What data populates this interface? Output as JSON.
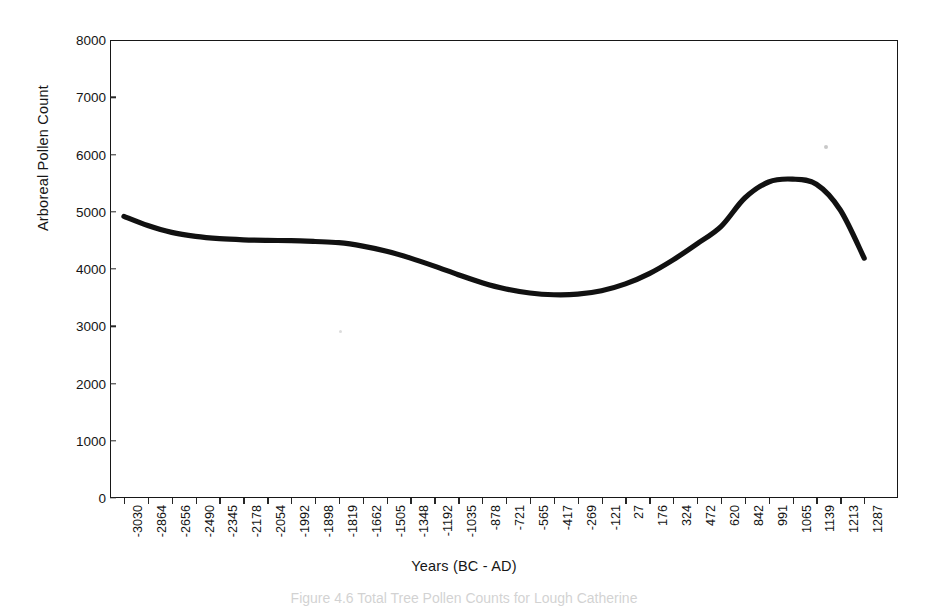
{
  "figure": {
    "caption": "Figure 4.6 Total Tree Pollen Counts for Lough Catherine"
  },
  "chart_data": {
    "type": "line",
    "title": "",
    "xlabel": "Years (BC - AD)",
    "ylabel": "Arboreal Pollen Count",
    "ylim": [
      0,
      8000
    ],
    "y_ticks": [
      0,
      1000,
      2000,
      3000,
      4000,
      5000,
      6000,
      7000,
      8000
    ],
    "grid": false,
    "legend": "none",
    "categories": [
      "-3030",
      "-2864",
      "-2656",
      "-2490",
      "-2345",
      "-2178",
      "-2054",
      "-1992",
      "-1898",
      "-1819",
      "-1662",
      "-1505",
      "-1348",
      "-1192",
      "-1035",
      "-878",
      "-721",
      "-565",
      "-417",
      "-269",
      "-121",
      "27",
      "176",
      "324",
      "472",
      "620",
      "842",
      "991",
      "1065",
      "1139",
      "1213",
      "1287"
    ],
    "x_tick_labels": [
      "-3030",
      "-2864",
      "-2656",
      "-2490",
      "-2345",
      "-2178",
      "-2054",
      "-1992",
      "-1898",
      "-1819",
      "-1662",
      "-1505",
      "-1348",
      "-1192",
      "-1035",
      "-878",
      "-721",
      "-565",
      "-417",
      "-269",
      "-121",
      "27",
      "176",
      "324",
      "472",
      "620",
      "842",
      "991",
      "1065",
      "1139",
      "1213",
      "1287"
    ],
    "series": [
      {
        "name": "Arboreal Pollen Count",
        "color": "#111111",
        "values": [
          4920,
          4760,
          4640,
          4570,
          4530,
          4510,
          4500,
          4495,
          4480,
          4460,
          4400,
          4310,
          4190,
          4050,
          3900,
          3760,
          3650,
          3580,
          3550,
          3560,
          3620,
          3740,
          3920,
          4160,
          4440,
          4740,
          5240,
          5520,
          5570,
          5480,
          5030,
          4190
        ]
      }
    ]
  }
}
